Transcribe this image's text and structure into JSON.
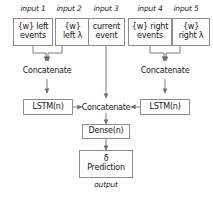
{
  "diagram": {
    "colors": {
      "background": "#ffffff",
      "box_fill": "#fdfdfd",
      "box_border": "#8c8c8c",
      "text": "#1a1a1a",
      "arrow": "#6e6e6e"
    },
    "inputs": [
      {
        "label": "input 1",
        "line1": "{w} left",
        "line2": "events"
      },
      {
        "label": "input 2",
        "line1": "{w}",
        "line2": "left λ"
      },
      {
        "label": "input 3",
        "line1": "current",
        "line2": "event"
      },
      {
        "label": "input 4",
        "line1": "{w} right",
        "line2": "events"
      },
      {
        "label": "input 5",
        "line1": "{w}",
        "line2": "right λ"
      }
    ],
    "merge_left": {
      "label": "Concatenate"
    },
    "merge_right": {
      "label": "Concatenate"
    },
    "lstm_left": {
      "label": "LSTM(n)"
    },
    "lstm_right": {
      "label": "LSTM(n)"
    },
    "merge_center": {
      "label": "Concatenate"
    },
    "dense": {
      "label": "Dense(n)"
    },
    "prediction": {
      "line1": "δ",
      "line2": "Prediction"
    },
    "output_label": "output"
  }
}
